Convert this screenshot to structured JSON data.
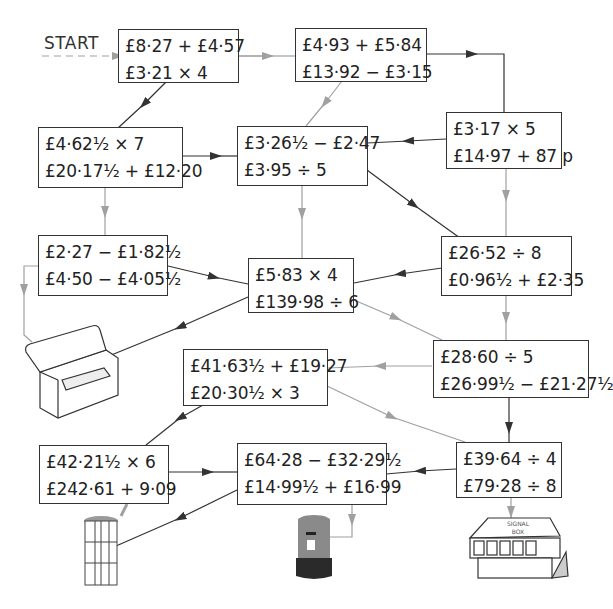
{
  "start_label": "START",
  "boxes": [
    {
      "id": "b1",
      "lines": [
        "£8·27 + £4·57",
        "£3·21 × 4"
      ]
    },
    {
      "id": "b2",
      "lines": [
        "£4·93 + £5·84",
        "£13·92 − £3·15"
      ]
    },
    {
      "id": "b3",
      "lines": [
        "£3·17 × 5",
        "£14·97 + 87 p"
      ]
    },
    {
      "id": "b4",
      "lines": [
        "£4·62½ × 7",
        "£20·17½ + £12·20"
      ]
    },
    {
      "id": "b5",
      "lines": [
        "£3·26½ − £2·47",
        "£3·95 ÷ 5"
      ]
    },
    {
      "id": "b6",
      "lines": [
        "£2·27 − £1·82½",
        "£4·50 − £4·05½"
      ]
    },
    {
      "id": "b7",
      "lines": [
        "£5·83 × 4",
        "£139·98 ÷ 6"
      ]
    },
    {
      "id": "b8",
      "lines": [
        "£26·52 ÷ 8",
        "£0·96½ + £2·35"
      ]
    },
    {
      "id": "b9",
      "lines": [
        "£41·63½ + £19·27",
        "£20·30½ × 3"
      ]
    },
    {
      "id": "b10",
      "lines": [
        "£28·60 ÷ 5",
        "£26·99½ − £21·27½"
      ]
    },
    {
      "id": "b11",
      "lines": [
        "£42·21½ × 6",
        "£242·61 + 9·09"
      ]
    },
    {
      "id": "b12",
      "lines": [
        "£64·28 − £32·29½",
        "£14·99½ + £16·99"
      ]
    },
    {
      "id": "b13",
      "lines": [
        "£39·64 ÷ 4",
        "£79·28 ÷ 8"
      ]
    }
  ],
  "destinations": [
    {
      "id": "lunch-box",
      "label": "lunch box"
    },
    {
      "id": "phone-box",
      "label": "telephone box"
    },
    {
      "id": "post-box",
      "label": "post box"
    },
    {
      "id": "signal-box",
      "label": "SIGNAL BOX",
      "sign_line1": "SIGNAL",
      "sign_line2": "BOX"
    }
  ],
  "colors": {
    "dark_arrow": "#333333",
    "grey_arrow": "#a0a0a0",
    "border": "#333333",
    "postbox_top": "#8a8a8a",
    "postbox_base": "#2a2a2a"
  }
}
